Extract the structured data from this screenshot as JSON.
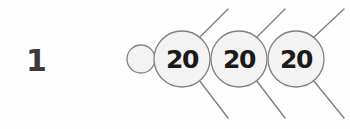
{
  "figure": {
    "item_number": "1",
    "background_color": "#fefefe",
    "stroke_color": "#808080",
    "circle_fill_color": "#f2f2f2",
    "text_color": "#1a1a1a",
    "number_color": "#3b3b3b",
    "type": "math-number-bond-chain",
    "lead_circle": {
      "label": "",
      "cx": 141,
      "cy": 59,
      "r": 14
    },
    "value_circles": [
      {
        "label": "20",
        "cx": 182,
        "cy": 59,
        "r": 28
      },
      {
        "label": "20",
        "cx": 239,
        "cy": 59,
        "r": 28
      },
      {
        "label": "20",
        "cx": 296,
        "cy": 59,
        "r": 28
      }
    ],
    "connector_lines": [
      {
        "x1": 199,
        "y1": 38,
        "x2": 228,
        "y2": 9
      },
      {
        "x1": 199,
        "y1": 80,
        "x2": 228,
        "y2": 118
      },
      {
        "x1": 256,
        "y1": 38,
        "x2": 285,
        "y2": 9
      },
      {
        "x1": 256,
        "y1": 80,
        "x2": 285,
        "y2": 118
      },
      {
        "x1": 313,
        "y1": 38,
        "x2": 344,
        "y2": 9
      },
      {
        "x1": 313,
        "y1": 80,
        "x2": 344,
        "y2": 118
      }
    ]
  }
}
